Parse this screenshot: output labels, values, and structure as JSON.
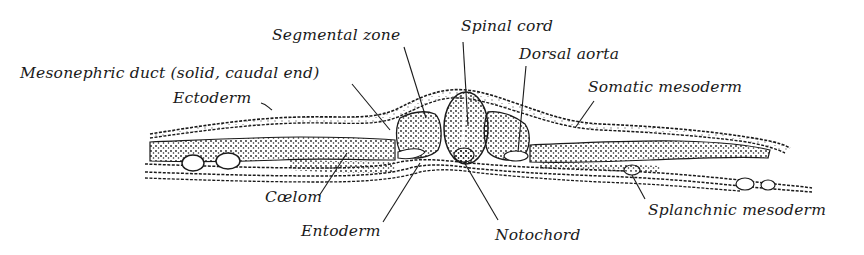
{
  "figure": {
    "type": "anatomical cross-section illustration",
    "colors": {
      "ink": "#1a1a1a",
      "background": "#ffffff"
    }
  },
  "labels": {
    "segmental_zone": "Segmental zone",
    "spinal_cord": "Spinal cord",
    "mesonephric_duct": "Mesonephric duct (solid, caudal end)",
    "dorsal_aorta": "Dorsal aorta",
    "ectoderm": "Ectoderm",
    "somatic_mesoderm": "Somatic mesoderm",
    "coelom": "Cœlom",
    "entoderm": "Entoderm",
    "notochord": "Notochord",
    "splanchnic_mesoderm": "Splanchnic mesoderm"
  }
}
